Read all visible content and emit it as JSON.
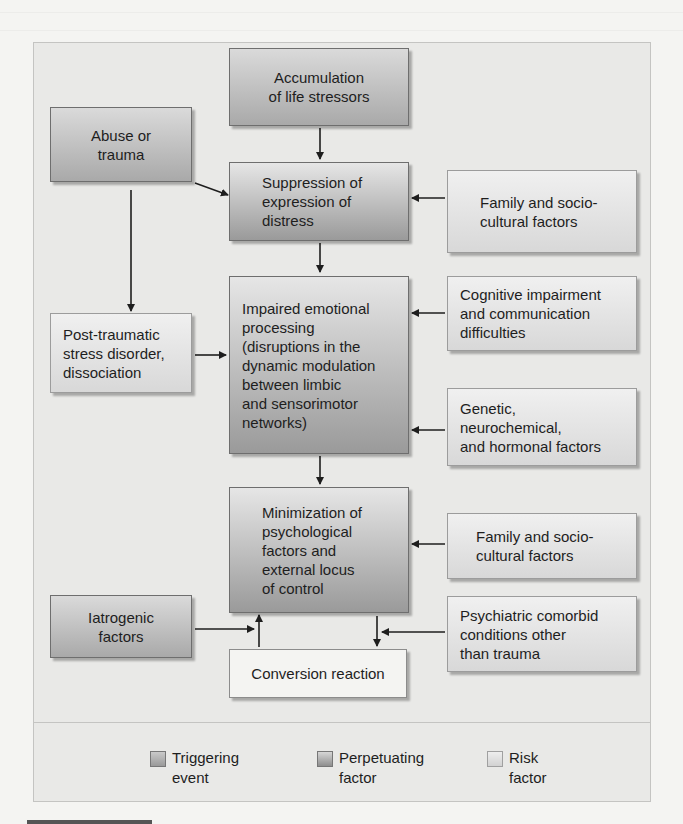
{
  "diagram": {
    "nodes": {
      "accumulation": {
        "label": "Accumulation\nof life stressors",
        "type": "triggering"
      },
      "abuse": {
        "label": "Abuse or\ntrauma",
        "type": "triggering"
      },
      "suppression": {
        "label": "Suppression of\nexpression of\ndistress",
        "type": "perpetuating"
      },
      "family1": {
        "label": "Family and socio-\ncultural factors",
        "type": "risk"
      },
      "impaired": {
        "label": "Impaired emotional\nprocessing\n(disruptions in the\ndynamic modulation\nbetween limbic\nand sensorimotor\nnetworks)",
        "type": "perpetuating"
      },
      "cognitive": {
        "label": "Cognitive impairment\nand communication\ndifficulties",
        "type": "risk"
      },
      "ptsd": {
        "label": "Post-traumatic\nstress disorder,\ndissociation",
        "type": "risk"
      },
      "genetic": {
        "label": "Genetic,\nneurochemical,\nand hormonal factors",
        "type": "risk"
      },
      "minimization": {
        "label": "Minimization of\npsychological\nfactors and\nexternal locus\nof control",
        "type": "perpetuating"
      },
      "family2": {
        "label": "Family and socio-\ncultural factors",
        "type": "risk"
      },
      "iatrogenic": {
        "label": "Iatrogenic\nfactors",
        "type": "triggering"
      },
      "psychiatric": {
        "label": "Psychiatric comorbid\nconditions other\nthan trauma",
        "type": "risk"
      },
      "conversion": {
        "label": "Conversion reaction",
        "type": "outcome"
      }
    },
    "edges": [
      {
        "from": "accumulation",
        "to": "suppression"
      },
      {
        "from": "abuse",
        "to": "suppression"
      },
      {
        "from": "abuse",
        "to": "ptsd"
      },
      {
        "from": "family1",
        "to": "suppression"
      },
      {
        "from": "suppression",
        "to": "impaired"
      },
      {
        "from": "cognitive",
        "to": "impaired"
      },
      {
        "from": "ptsd",
        "to": "impaired"
      },
      {
        "from": "genetic",
        "to": "impaired"
      },
      {
        "from": "impaired",
        "to": "minimization"
      },
      {
        "from": "family2",
        "to": "minimization"
      },
      {
        "from": "iatrogenic",
        "to": "minimization"
      },
      {
        "from": "conversion",
        "to": "minimization"
      },
      {
        "from": "minimization",
        "to": "conversion"
      },
      {
        "from": "psychiatric",
        "to": "conversion"
      }
    ]
  },
  "legend": {
    "items": [
      {
        "label": "Triggering\nevent",
        "type": "triggering"
      },
      {
        "label": "Perpetuating\nfactor",
        "type": "perpetuating"
      },
      {
        "label": "Risk\nfactor",
        "type": "risk"
      }
    ]
  },
  "colors": {
    "panel_bg": "#e9e9e7",
    "triggering": "#a9a9a9",
    "perpetuating": "#9a9a9a",
    "risk": "#d8d8d8",
    "arrow": "#1e1e1e"
  }
}
